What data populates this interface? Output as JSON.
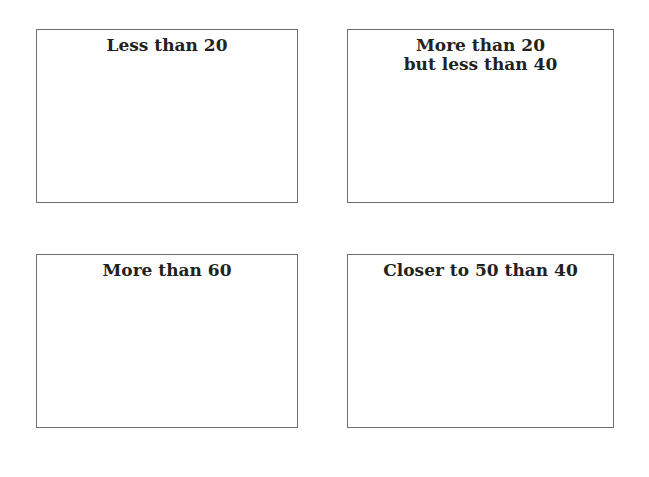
{
  "cards": [
    {
      "lines": [
        "Less than 20"
      ]
    },
    {
      "lines": [
        "More than 20",
        "but less than 40"
      ]
    },
    {
      "lines": [
        "More than 60"
      ]
    },
    {
      "lines": [
        "Closer to 50 than 40"
      ]
    }
  ]
}
